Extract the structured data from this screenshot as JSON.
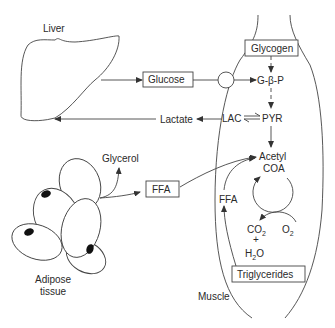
{
  "organs": {
    "liver": "Liver",
    "muscle": "Muscle",
    "adipose_line1": "Adipose",
    "adipose_line2": "tissue"
  },
  "boxes": {
    "glucose": "Glucose",
    "glycogen": "Glycogen",
    "ffa": "FFA",
    "triglycerides": "Triglycerides"
  },
  "metabolites": {
    "g6p": "G-β-P",
    "lac": "LAC",
    "pyr": "PYR",
    "lactate": "Lactate",
    "glycerol": "Glycerol",
    "acetyl": "Acetyl",
    "coa": "COA",
    "ffa_muscle": "FFA",
    "co2": "CO",
    "co2_sub": "2",
    "plus": "+",
    "h2o_h": "H",
    "h2o_sub": "2",
    "h2o_o": "O",
    "o2": "O",
    "o2_sub": "2"
  }
}
